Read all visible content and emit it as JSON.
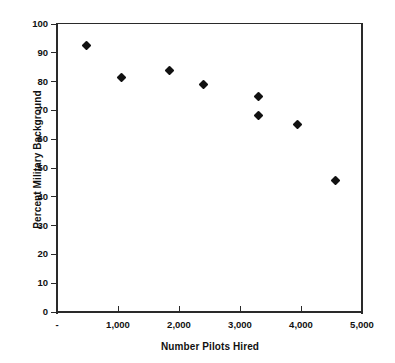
{
  "chart_data": {
    "type": "scatter",
    "title": "",
    "xlabel": "Number Pilots Hired",
    "ylabel": "Percent Military Background",
    "xlim": [
      0,
      5000
    ],
    "ylim": [
      0,
      100
    ],
    "grid": false,
    "legend": null,
    "marker": "filled-diamond",
    "marker_color": "#111111",
    "xticks": [
      0,
      1000,
      2000,
      3000,
      4000,
      5000
    ],
    "xtick_labels": [
      "-",
      "1,000",
      "2,000",
      "3,000",
      "4,000",
      "5,000"
    ],
    "yticks": [
      0,
      10,
      20,
      30,
      40,
      50,
      60,
      70,
      80,
      90,
      100
    ],
    "ytick_labels": [
      "0",
      "10",
      "20",
      "30",
      "40",
      "50",
      "60",
      "70",
      "80",
      "90",
      "100"
    ],
    "points": [
      {
        "x": 480,
        "y": 92.5
      },
      {
        "x": 1060,
        "y": 81.5
      },
      {
        "x": 1850,
        "y": 84.0
      },
      {
        "x": 2400,
        "y": 79.0
      },
      {
        "x": 3300,
        "y": 74.7
      },
      {
        "x": 3310,
        "y": 68.2
      },
      {
        "x": 3950,
        "y": 65.0
      },
      {
        "x": 4570,
        "y": 45.5
      }
    ]
  }
}
